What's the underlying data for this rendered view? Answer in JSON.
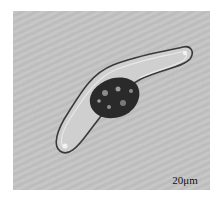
{
  "image": {
    "subject": "diatom cell micrograph",
    "scale_bar": {
      "label": "20μm"
    },
    "colors": {
      "border": "#ffffff",
      "background": "#c2c2c2",
      "scale_bar": "#111111"
    }
  }
}
